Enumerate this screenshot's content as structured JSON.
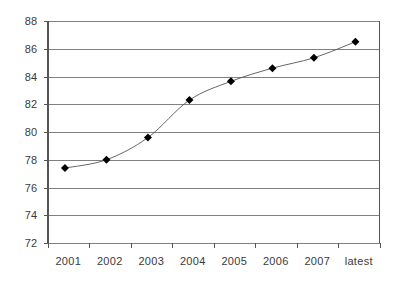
{
  "chart_data": {
    "type": "line",
    "title": "",
    "subtitle": "",
    "xlabel": "",
    "ylabel": "",
    "categories": [
      "2001",
      "2002",
      "2003",
      "2004",
      "2005",
      "2006",
      "2007",
      "latest"
    ],
    "values": [
      77.4,
      78.0,
      79.6,
      82.3,
      83.65,
      84.6,
      85.35,
      86.5
    ],
    "series": [
      {
        "name": "",
        "values": [
          77.4,
          78.0,
          79.6,
          82.3,
          83.65,
          84.6,
          85.35,
          86.5
        ]
      }
    ],
    "ylim": [
      72,
      88
    ],
    "yticks": [
      72,
      74,
      76,
      78,
      80,
      82,
      84,
      86,
      88
    ],
    "ytick_labels": [
      "72",
      "74",
      "76",
      "78",
      "80",
      "82",
      "84",
      "86",
      "88"
    ],
    "grid": true,
    "grid_axis": "y",
    "legend": false,
    "legend_position": "none",
    "marker": "diamond",
    "marker_size": 4,
    "line_color": "#555555",
    "marker_color": "#000000",
    "grid_color": "#808080",
    "axis_color": "#555555",
    "background": "#ffffff"
  }
}
